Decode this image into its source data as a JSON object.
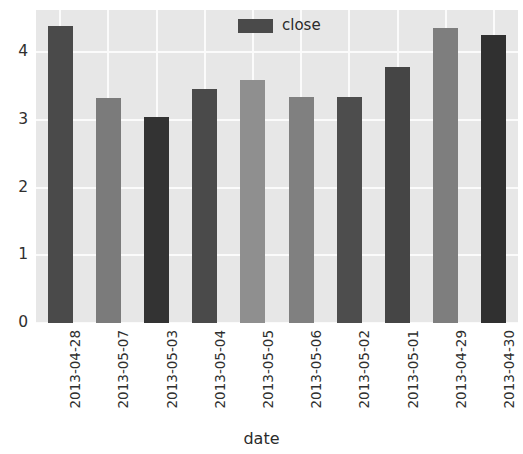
{
  "chart_data": {
    "type": "bar",
    "title": "",
    "xlabel": "date",
    "ylabel": "",
    "categories": [
      "2013-04-28",
      "2013-05-07",
      "2013-05-03",
      "2013-05-04",
      "2013-05-05",
      "2013-05-06",
      "2013-05-02",
      "2013-05-01",
      "2013-04-29",
      "2013-04-30"
    ],
    "series": [
      {
        "name": "close",
        "values": [
          4.38,
          3.32,
          3.04,
          3.45,
          3.58,
          3.34,
          3.33,
          3.78,
          4.35,
          4.25
        ]
      }
    ],
    "bar_colors": [
      "#4a4a4a",
      "#7b7b7b",
      "#333333",
      "#4a4a4a",
      "#8f8f8f",
      "#808080",
      "#4d4d4d",
      "#454545",
      "#7e7e7e",
      "#303030"
    ],
    "ylim": [
      0,
      4.62
    ],
    "yticks": [
      0,
      1,
      2,
      3,
      4
    ],
    "ytick_labels": [
      "0",
      "1",
      "2",
      "3",
      "4"
    ],
    "grid": true,
    "grid_color": "#fbfbfb",
    "plot_background": "#e7e7e7",
    "figure_background": "#ffffff",
    "legend": {
      "position": "upper center",
      "entries": [
        {
          "label": "close",
          "color": "#4a4a4a"
        }
      ]
    }
  },
  "axis": {
    "x_title": "date"
  },
  "legend": {
    "label": "close"
  }
}
